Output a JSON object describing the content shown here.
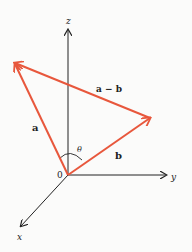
{
  "diagram": {
    "axes": {
      "z_label": "z",
      "y_label": "y",
      "x_label": "x",
      "origin_label": "0"
    },
    "vectors": {
      "a_label": "a",
      "b_label": "b",
      "diff_label": "a − b"
    },
    "angle_label": "θ",
    "colors": {
      "vector": "#e8573c",
      "axis": "#222222",
      "background": "#fbfbfa"
    }
  }
}
